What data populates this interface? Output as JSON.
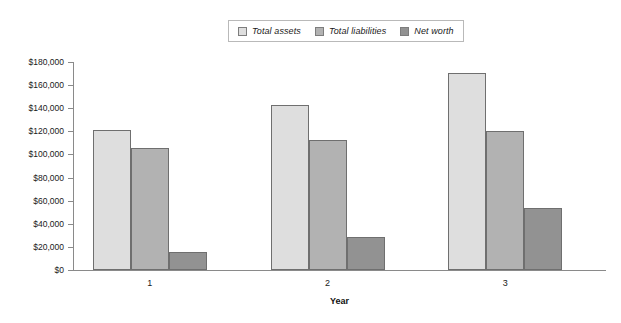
{
  "chart_data": {
    "type": "bar",
    "title": "",
    "xlabel": "Year",
    "ylabel": "",
    "categories": [
      "1",
      "2",
      "3"
    ],
    "series": [
      {
        "name": "Total assets",
        "color": "#dedede",
        "values": [
          121000,
          143000,
          170500
        ]
      },
      {
        "name": "Total liabilities",
        "color": "#b2b2b2",
        "values": [
          106000,
          112500,
          120000
        ]
      },
      {
        "name": "Net worth",
        "color": "#929292",
        "values": [
          15500,
          28500,
          53500
        ]
      }
    ],
    "ylim": [
      0,
      180000
    ],
    "ytick_values": [
      0,
      20000,
      40000,
      60000,
      80000,
      100000,
      120000,
      140000,
      160000,
      180000
    ],
    "ytick_labels": [
      "$0",
      "$20,000",
      "$40,000",
      "$60,000",
      "$80,000",
      "$100,000",
      "$120,000",
      "$140,000",
      "$160,000",
      "$180,000"
    ],
    "grid": false,
    "legend_position": "top-center"
  },
  "legend": {
    "items": [
      {
        "label": "Total assets",
        "swatch": "#dedede"
      },
      {
        "label": "Total liabilities",
        "swatch": "#b2b2b2"
      },
      {
        "label": "Net worth",
        "swatch": "#929292"
      }
    ]
  },
  "axis": {
    "x_title": "Year"
  }
}
